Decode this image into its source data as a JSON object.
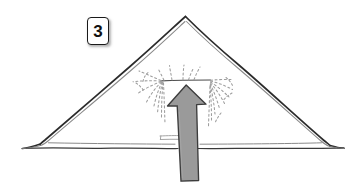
{
  "canvas": {
    "width": 361,
    "height": 193,
    "background_color": "#ffffff"
  },
  "step_badge": {
    "label": "3",
    "border_color": "#1a1a1a",
    "fill_color": "#ffffff",
    "text_color": "#111111"
  },
  "illustration": {
    "title": "tent-shelter-with-rising-air-arrow",
    "description": "Hand-drawn tent or pyramid shelter seen from the front, with a large gray upward arrow rising through its interior and faint dotted rays radiating outward.",
    "line_color": "#2b2b2b",
    "secondary_line_color": "#7a7a7a",
    "ground_line_color": "#3a3a3a",
    "ray_color": "#9d9d9d",
    "arrow": {
      "name": "upward-arrow",
      "fill_color": "#9a9a9a",
      "stroke_color": "#3c3c3c",
      "direction": "up"
    },
    "parts": [
      "tent-outer-outline",
      "tent-inner-outline",
      "ground-line",
      "interior-shelf-line",
      "radiating-dotted-rays",
      "upward-arrow"
    ]
  }
}
